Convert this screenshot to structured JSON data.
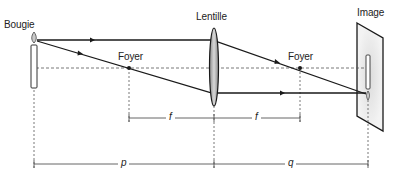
{
  "diagram": {
    "labels": {
      "candle": "Bougie",
      "lens": "Lentille",
      "focus_left": "Foyer",
      "focus_right": "Foyer",
      "image": "Image",
      "focal_left": "f",
      "focal_right": "f",
      "object_distance": "p",
      "image_distance": "q"
    },
    "colors": {
      "line": "#1a1a1a",
      "dashed": "#555555",
      "lens_fill": "#b8b8b8",
      "screen_fill": "#ececec"
    }
  }
}
